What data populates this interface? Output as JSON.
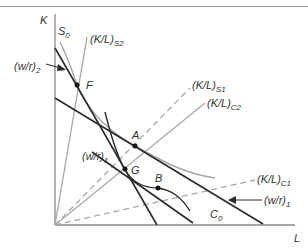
{
  "diagram": {
    "axes": {
      "y_label": "K",
      "x_label": "L"
    },
    "labels": {
      "s0": "S",
      "s0_sub": "0",
      "kl_s2": "(K/L)",
      "kl_s2_sub": "S2",
      "kl_s1": "(K/L)",
      "kl_s1_sub": "S1",
      "kl_c2": "(K/L)",
      "kl_c2_sub": "C2",
      "kl_c1": "(K/L)",
      "kl_c1_sub": "C1",
      "wr2": "(w/r)",
      "wr2_sub": "2",
      "wr1_left": "(w/r)",
      "wr1_left_sub": "1",
      "wr1_right": "(w/r)",
      "wr1_right_sub": "1",
      "c0": "C",
      "c0_sub": "0"
    },
    "points": {
      "F": "F",
      "A": "A",
      "G": "G",
      "B": "B"
    },
    "colors": {
      "dark_line": "#2a2a2a",
      "grey_line": "#a8a8a8",
      "axis": "#8a8a8a"
    }
  }
}
